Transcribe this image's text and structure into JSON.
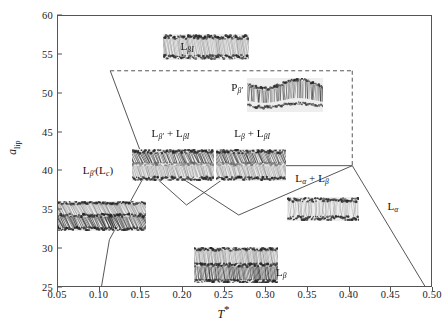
{
  "chart_data": {
    "type": "scatter",
    "title": "",
    "xlabel": "T*",
    "ylabel": "a_lip",
    "xlim": [
      0.05,
      0.5
    ],
    "ylim": [
      25,
      60
    ],
    "grid": false,
    "legend_position": "none",
    "xticks": [
      "0.05",
      "0.10",
      "0.15",
      "0.20",
      "0.25",
      "0.30",
      "0.35",
      "0.40",
      "0.45",
      "0.50"
    ],
    "xtick_values": [
      0.05,
      0.1,
      0.15,
      0.2,
      0.25,
      0.3,
      0.35,
      0.4,
      0.45,
      0.5
    ],
    "yticks": [
      "25",
      "30",
      "35",
      "40",
      "45",
      "50",
      "55",
      "60"
    ],
    "ytick_values": [
      25,
      30,
      35,
      40,
      45,
      50,
      55,
      60
    ],
    "regions": [
      {
        "id": "region-lbi",
        "label": "LβI",
        "x": 0.205,
        "y": 56.2
      },
      {
        "id": "region-pbeta",
        "label": "Pβ'",
        "x": 0.265,
        "y": 50.8
      },
      {
        "id": "region-lbp-lbi",
        "label": "Lβ' + LβI",
        "x": 0.185,
        "y": 45.0
      },
      {
        "id": "region-lb-lbi",
        "label": "Lβ + LβI",
        "x": 0.283,
        "y": 45.0
      },
      {
        "id": "region-lbp-lc",
        "label": "Lβ'(Lc)",
        "x": 0.098,
        "y": 40.2
      },
      {
        "id": "region-la-lb",
        "label": "Lα + Lβ",
        "x": 0.355,
        "y": 39.2
      },
      {
        "id": "region-la",
        "label": "Lα",
        "x": 0.452,
        "y": 35.6
      },
      {
        "id": "region-lb",
        "label": "Lβ",
        "x": 0.318,
        "y": 27.0
      }
    ],
    "boundaries": [
      {
        "id": "boundary-pbeta-top",
        "style": "dashed",
        "points": [
          [
            0.113,
            52.9
          ],
          [
            0.405,
            52.9
          ]
        ]
      },
      {
        "id": "boundary-pbeta-right",
        "style": "dashed",
        "points": [
          [
            0.405,
            52.9
          ],
          [
            0.405,
            40.6
          ]
        ]
      },
      {
        "id": "boundary-lbp-lc-right",
        "style": "solid",
        "points": [
          [
            0.113,
            52.9
          ],
          [
            0.158,
            40.0
          ]
        ]
      },
      {
        "id": "boundary-lbp-mid",
        "style": "solid",
        "points": [
          [
            0.158,
            40.0
          ],
          [
            0.205,
            35.5
          ]
        ]
      },
      {
        "id": "boundary-lbp-lower",
        "style": "solid",
        "points": [
          [
            0.158,
            40.0
          ],
          [
            0.112,
            31.0
          ]
        ]
      },
      {
        "id": "boundary-lb-lower-left",
        "style": "solid",
        "points": [
          [
            0.112,
            31.0
          ],
          [
            0.101,
            24.0
          ]
        ]
      },
      {
        "id": "boundary-cross-up",
        "style": "solid",
        "points": [
          [
            0.205,
            35.5
          ],
          [
            0.272,
            40.6
          ]
        ]
      },
      {
        "id": "boundary-cross-down",
        "style": "solid",
        "points": [
          [
            0.176,
            40.6
          ],
          [
            0.268,
            34.2
          ]
        ]
      },
      {
        "id": "boundary-mid-to-right",
        "style": "solid",
        "points": [
          [
            0.268,
            34.2
          ],
          [
            0.405,
            40.6
          ]
        ]
      },
      {
        "id": "boundary-right-down",
        "style": "solid",
        "points": [
          [
            0.405,
            40.6
          ],
          [
            0.497,
            24.2
          ]
        ]
      },
      {
        "id": "boundary-lbi-base",
        "style": "solid",
        "points": [
          [
            0.272,
            40.6
          ],
          [
            0.405,
            40.6
          ]
        ]
      }
    ],
    "snapshots": [
      {
        "id": "snapshot-lbi",
        "x": 0.228,
        "y": 56.0,
        "w": 86,
        "h": 26,
        "kind": "interdigitated"
      },
      {
        "id": "snapshot-pbeta",
        "x": 0.322,
        "y": 49.8,
        "w": 76,
        "h": 34,
        "kind": "ripple"
      },
      {
        "id": "snapshot-lbp-lbi",
        "x": 0.188,
        "y": 40.8,
        "w": 82,
        "h": 32,
        "kind": "mixed-tilted"
      },
      {
        "id": "snapshot-lb-lbi",
        "x": 0.282,
        "y": 40.8,
        "w": 70,
        "h": 32,
        "kind": "mixed-tilted"
      },
      {
        "id": "snapshot-lbp-lc",
        "x": 0.098,
        "y": 34.3,
        "w": 96,
        "h": 30,
        "kind": "tilted-gel"
      },
      {
        "id": "snapshot-la-lb",
        "x": 0.368,
        "y": 35.2,
        "w": 72,
        "h": 24,
        "kind": "fluid"
      },
      {
        "id": "snapshot-lb",
        "x": 0.263,
        "y": 28.0,
        "w": 84,
        "h": 36,
        "kind": "gel"
      }
    ]
  },
  "colors": {
    "axis": "#555555",
    "text": "#111111",
    "background": "#ffffff",
    "snapshot_light": "#d9d9d9",
    "snapshot_dark": "#3a3a3a"
  }
}
